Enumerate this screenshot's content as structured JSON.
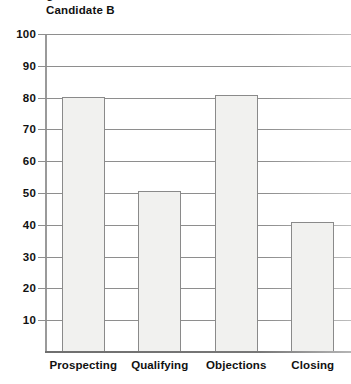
{
  "chart_data": {
    "type": "bar",
    "title": "Candidate B",
    "xlabel": "",
    "ylabel": "",
    "categories": [
      "Prospecting",
      "Qualifying",
      "Objections",
      "Closing"
    ],
    "values": [
      80.3,
      50.5,
      80.8,
      41.0
    ],
    "ylim": [
      0,
      100
    ],
    "yticks": [
      10,
      20,
      30,
      40,
      50,
      60,
      70,
      80,
      90,
      100
    ],
    "ytick_labels": [
      "10",
      "20",
      "30",
      "40",
      "50",
      "60",
      "70",
      "80",
      "90",
      "100"
    ],
    "grid": true,
    "legend": false,
    "legend_position": "none",
    "bar_fill_color": "#f1f1ef",
    "bar_border_color": "#8a8a8a",
    "gridline_color": "#8e8e8e",
    "axis_color": "#7a7a7a",
    "text_color": "#111111"
  },
  "clipped_header_text": "g"
}
